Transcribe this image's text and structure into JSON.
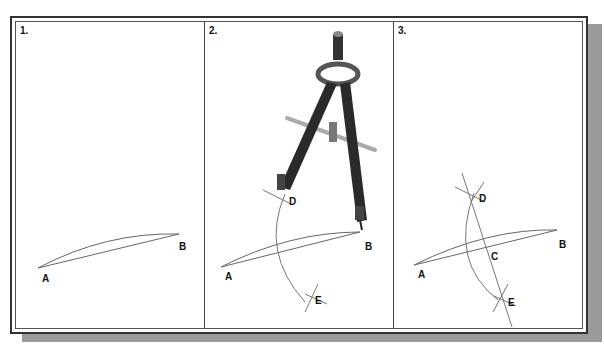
{
  "figure": {
    "panels": [
      {
        "number": "1.",
        "points": {
          "A": "A",
          "B": "B"
        }
      },
      {
        "number": "2.",
        "points": {
          "A": "A",
          "B": "B",
          "D": "D",
          "E": "E"
        },
        "tool": "compass"
      },
      {
        "number": "3.",
        "points": {
          "A": "A",
          "B": "B",
          "C": "C",
          "D": "D",
          "E": "E"
        }
      }
    ],
    "colors": {
      "line": "#555555",
      "frame": "#333333",
      "shadow": "#9a9a9a",
      "compass": "#2a2a2a"
    }
  }
}
